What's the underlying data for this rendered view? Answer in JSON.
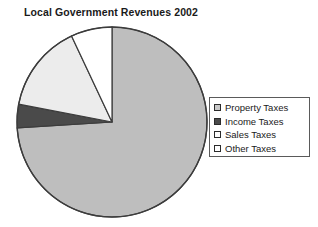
{
  "chart_data": {
    "type": "pie",
    "title": "Local Government Revenues 2002",
    "xlabel": "",
    "ylabel": "",
    "categories": [
      "Property Taxes",
      "Income Taxes",
      "Sales Taxes",
      "Other Taxes"
    ],
    "values": [
      74,
      4,
      15,
      7
    ],
    "units": "percent",
    "start_angle_deg": 0,
    "direction": "clockwise",
    "legend_position": "right",
    "grid": false,
    "slices": [
      {
        "label": "Property Taxes",
        "value": 74,
        "color": "#bebebe",
        "start_deg": 0,
        "end_deg": 266.4
      },
      {
        "label": "Income Taxes",
        "value": 4,
        "color": "#4a4a4a",
        "start_deg": 266.4,
        "end_deg": 280.8
      },
      {
        "label": "Sales Taxes",
        "value": 15,
        "color": "#ececec",
        "start_deg": 280.8,
        "end_deg": 334.8
      },
      {
        "label": "Other Taxes",
        "value": 7,
        "color": "#ffffff",
        "start_deg": 334.8,
        "end_deg": 360
      }
    ]
  },
  "title": {
    "text": "Local Government Revenues 2002"
  },
  "pie": {
    "center_x": 112,
    "center_y": 122,
    "radius": 95,
    "outline_color": "#3c3c3c"
  },
  "legend": {
    "items": [
      {
        "label": "Property Taxes",
        "swatch_color": "#c8c8c8",
        "swatch_name": "legend-swatch-property-taxes"
      },
      {
        "label": "Income Taxes",
        "swatch_color": "#4a4a4a",
        "swatch_name": "legend-swatch-income-taxes"
      },
      {
        "label": "Sales Taxes",
        "swatch_color": "#fdfdfd",
        "swatch_name": "legend-swatch-sales-taxes"
      },
      {
        "label": "Other Taxes",
        "swatch_color": "#ffffff",
        "swatch_name": "legend-swatch-other-taxes"
      }
    ]
  }
}
